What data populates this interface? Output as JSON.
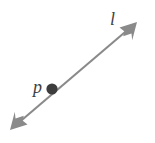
{
  "figure": {
    "kind": "geometry-diagram",
    "background_color": "#ffffff",
    "width": 155,
    "height": 143
  },
  "labels": {
    "line_label": "l",
    "point_label": "p"
  },
  "geometry": {
    "line": {
      "name": "line-l",
      "color": "#8a8a8a",
      "stroke_width": 2,
      "start": {
        "x": 16,
        "y": 125
      },
      "end": {
        "x": 131,
        "y": 27
      },
      "arrowheads": "both"
    },
    "arrowhead_start": {
      "name": "arrowhead-lower-left",
      "tip": {
        "x": 10,
        "y": 130
      },
      "color": "#8a8a8a"
    },
    "arrowhead_end": {
      "name": "arrowhead-upper-right",
      "tip": {
        "x": 137,
        "y": 22
      },
      "color": "#8a8a8a"
    },
    "point": {
      "name": "point-p",
      "center": {
        "x": 52,
        "y": 89
      },
      "radius": 5.5,
      "color": "#3d3d3d"
    }
  },
  "colors": {
    "line": "#8a8a8a",
    "point": "#3d3d3d",
    "label": "#3f3f3f",
    "background": "#ffffff"
  }
}
